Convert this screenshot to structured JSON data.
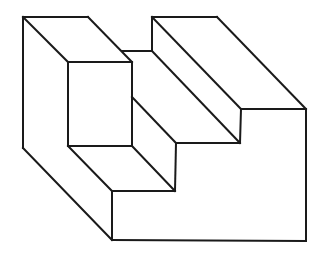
{
  "figure": {
    "title": "Isometric staircase block line drawing",
    "stroke_color": "#1a1a1a",
    "background": "#ffffff",
    "edges": [
      {
        "id": "left-top-back",
        "x1": 23,
        "y1": 17,
        "x2": 88,
        "y2": 17
      },
      {
        "id": "left-block-diag-outer",
        "x1": 23,
        "y1": 17,
        "x2": 68,
        "y2": 62
      },
      {
        "id": "left-block-diag-inner",
        "x1": 88,
        "y1": 17,
        "x2": 132,
        "y2": 62
      },
      {
        "id": "left-outer-vertical",
        "x1": 23,
        "y1": 17,
        "x2": 23,
        "y2": 148
      },
      {
        "id": "left-bottom-diag",
        "x1": 23,
        "y1": 148,
        "x2": 112,
        "y2": 240
      },
      {
        "id": "front-box-top",
        "x1": 68,
        "y1": 62,
        "x2": 132,
        "y2": 62
      },
      {
        "id": "front-box-left",
        "x1": 68,
        "y1": 62,
        "x2": 68,
        "y2": 146
      },
      {
        "id": "front-box-right",
        "x1": 132,
        "y1": 62,
        "x2": 132,
        "y2": 146
      },
      {
        "id": "front-box-bottom",
        "x1": 68,
        "y1": 146,
        "x2": 132,
        "y2": 146
      },
      {
        "id": "mid-step-top",
        "x1": 122,
        "y1": 51,
        "x2": 152,
        "y2": 51
      },
      {
        "id": "right-block-back-vertical",
        "x1": 152,
        "y1": 17,
        "x2": 152,
        "y2": 51
      },
      {
        "id": "right-block-top-back",
        "x1": 152,
        "y1": 17,
        "x2": 217,
        "y2": 17
      },
      {
        "id": "right-block-diag-outer",
        "x1": 217,
        "y1": 17,
        "x2": 306,
        "y2": 109
      },
      {
        "id": "right-block-diag-inner",
        "x1": 152,
        "y1": 17,
        "x2": 241,
        "y2": 109
      },
      {
        "id": "mid-step-diag",
        "x1": 152,
        "y1": 51,
        "x2": 240,
        "y2": 143
      },
      {
        "id": "right-block-front-top",
        "x1": 241,
        "y1": 109,
        "x2": 306,
        "y2": 109
      },
      {
        "id": "right-step-vertical",
        "x1": 241,
        "y1": 109,
        "x2": 240,
        "y2": 143
      },
      {
        "id": "mid-step-front-bottom",
        "x1": 176,
        "y1": 143,
        "x2": 240,
        "y2": 143
      },
      {
        "id": "lower-step-riser-diag",
        "x1": 132,
        "y1": 97,
        "x2": 176,
        "y2": 143
      },
      {
        "id": "lower-step-riser-vertical",
        "x1": 176,
        "y1": 143,
        "x2": 175,
        "y2": 191
      },
      {
        "id": "lower-tread-diag-left",
        "x1": 68,
        "y1": 146,
        "x2": 112,
        "y2": 191
      },
      {
        "id": "lower-tread-diag-right",
        "x1": 132,
        "y1": 146,
        "x2": 175,
        "y2": 191
      },
      {
        "id": "lower-tread-front",
        "x1": 112,
        "y1": 191,
        "x2": 175,
        "y2": 191
      },
      {
        "id": "front-face-left-vertical",
        "x1": 112,
        "y1": 191,
        "x2": 112,
        "y2": 240
      },
      {
        "id": "base-bottom",
        "x1": 112,
        "y1": 240,
        "x2": 306,
        "y2": 241
      },
      {
        "id": "right-face-vertical",
        "x1": 306,
        "y1": 109,
        "x2": 306,
        "y2": 241
      }
    ]
  }
}
